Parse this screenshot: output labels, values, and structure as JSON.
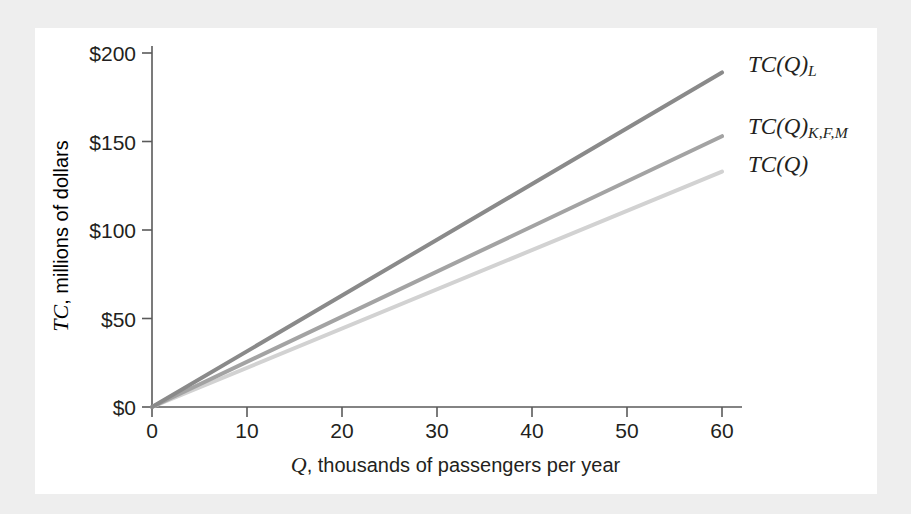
{
  "figure": {
    "background_color": "#eeeeee",
    "panel_color": "#ffffff"
  },
  "chart_data": {
    "type": "line",
    "title": "",
    "xlabel_italic": "Q",
    "xlabel_rest": ", thousands of passengers per year",
    "ylabel_italic": "TC",
    "ylabel_rest": ", millions of dollars",
    "xlim": [
      0,
      64
    ],
    "ylim": [
      0,
      205
    ],
    "xticks": [
      0,
      10,
      20,
      30,
      40,
      50,
      60
    ],
    "xticklabels": [
      "0",
      "10",
      "20",
      "30",
      "40",
      "50",
      "60"
    ],
    "yticks": [
      0,
      50,
      100,
      150,
      200
    ],
    "yticklabels": [
      "$0",
      "$50",
      "$100",
      "$150",
      "$200"
    ],
    "grid": false,
    "legend_position": "right-of-line-ends",
    "x": [
      0,
      60
    ],
    "series": [
      {
        "name": "TC(Q)_L",
        "label_main": "TC(Q)",
        "label_sub": "L",
        "color": "#8a8a8a",
        "values": [
          0,
          189
        ],
        "slope": 3.15
      },
      {
        "name": "TC(Q)_K,F,M",
        "label_main": "TC(Q)",
        "label_sub": "K,F,M",
        "color": "#a3a3a3",
        "values": [
          0,
          153
        ],
        "slope": 2.55
      },
      {
        "name": "TC(Q)",
        "label_main": "TC(Q)",
        "label_sub": "",
        "color": "#d2d2d2",
        "values": [
          0,
          133
        ],
        "slope": 2.22
      }
    ],
    "axis_color": "#5a5a5a"
  }
}
